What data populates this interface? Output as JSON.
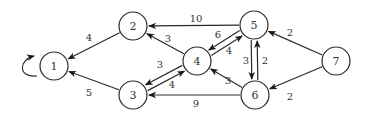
{
  "diagram": {
    "type": "directed-weighted-graph",
    "colors": {
      "stroke": "#2a2a2a",
      "text": "#333333",
      "background": "#ffffff"
    },
    "node_radius": 14,
    "nodes": [
      {
        "id": "1",
        "label": "1",
        "x": 54,
        "y": 66
      },
      {
        "id": "2",
        "label": "2",
        "x": 133,
        "y": 26
      },
      {
        "id": "3",
        "label": "3",
        "x": 133,
        "y": 95
      },
      {
        "id": "4",
        "label": "4",
        "x": 197,
        "y": 61
      },
      {
        "id": "5",
        "label": "5",
        "x": 254,
        "y": 25
      },
      {
        "id": "6",
        "label": "6",
        "x": 255,
        "y": 95
      },
      {
        "id": "7",
        "label": "7",
        "x": 336,
        "y": 61
      }
    ],
    "edges": [
      {
        "from": "1",
        "to": "1",
        "weight": "",
        "self_loop": true
      },
      {
        "from": "2",
        "to": "1",
        "weight": "4",
        "label_x": 89,
        "label_y": 37
      },
      {
        "from": "3",
        "to": "1",
        "weight": "5",
        "label_x": 89,
        "label_y": 92
      },
      {
        "from": "4",
        "to": "2",
        "weight": "3",
        "label_x": 168,
        "label_y": 38
      },
      {
        "from": "5",
        "to": "2",
        "weight": "10",
        "label_x": 196,
        "label_y": 18
      },
      {
        "from": "4",
        "to": "3",
        "weight": "3",
        "label_x": 160,
        "label_y": 64
      },
      {
        "from": "3",
        "to": "4",
        "weight": "4",
        "label_x": 172,
        "label_y": 84
      },
      {
        "from": "6",
        "to": "3",
        "weight": "9",
        "label_x": 196,
        "label_y": 103
      },
      {
        "from": "5",
        "to": "4",
        "weight": "6",
        "label_x": 218,
        "label_y": 34
      },
      {
        "from": "4",
        "to": "5",
        "weight": "4",
        "label_x": 229,
        "label_y": 50
      },
      {
        "from": "6",
        "to": "4",
        "weight": "3",
        "label_x": 228,
        "label_y": 80
      },
      {
        "from": "6",
        "to": "5",
        "weight": "3",
        "label_x": 246,
        "label_y": 60
      },
      {
        "from": "5",
        "to": "6",
        "weight": "2",
        "label_x": 265,
        "label_y": 60
      },
      {
        "from": "7",
        "to": "5",
        "weight": "2",
        "label_x": 290,
        "label_y": 32
      },
      {
        "from": "7",
        "to": "6",
        "weight": "2",
        "label_x": 290,
        "label_y": 96
      }
    ]
  }
}
